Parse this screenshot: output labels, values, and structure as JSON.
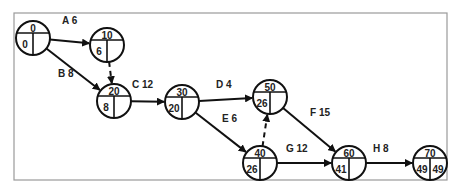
{
  "diagram": {
    "type": "activity-on-arrow network (CPM)",
    "frame": {
      "x": 14,
      "y": 13,
      "w": 433,
      "h": 167,
      "stroke": "#9a9a9a"
    },
    "nodes": [
      {
        "id": "0",
        "x": 33,
        "y": 38,
        "label": "0",
        "es": "0",
        "ls": ""
      },
      {
        "id": "10",
        "x": 107,
        "y": 45,
        "label": "10",
        "es": "6",
        "ls": ""
      },
      {
        "id": "20",
        "x": 114,
        "y": 101,
        "label": "20",
        "es": "8",
        "ls": ""
      },
      {
        "id": "30",
        "x": 182,
        "y": 102,
        "label": "30",
        "es": "20",
        "ls": ""
      },
      {
        "id": "50",
        "x": 270,
        "y": 97,
        "label": "50",
        "es": "26",
        "ls": ""
      },
      {
        "id": "40",
        "x": 260,
        "y": 163,
        "label": "40",
        "es": "26",
        "ls": ""
      },
      {
        "id": "60",
        "x": 349,
        "y": 163,
        "label": "60",
        "es": "41",
        "ls": ""
      },
      {
        "id": "70",
        "x": 430,
        "y": 163,
        "label": "70",
        "es": "49",
        "ls": "49"
      }
    ],
    "edges": [
      {
        "from": "0",
        "to": "10",
        "label": "A 6",
        "dummy": false,
        "lx": 62,
        "ly": 24
      },
      {
        "from": "0",
        "to": "20",
        "label": "B 8",
        "dummy": false,
        "lx": 58,
        "ly": 77
      },
      {
        "from": "10",
        "to": "20",
        "label": "",
        "dummy": true,
        "lx": 0,
        "ly": 0
      },
      {
        "from": "20",
        "to": "30",
        "label": "C 12",
        "dummy": false,
        "lx": 132,
        "ly": 88
      },
      {
        "from": "30",
        "to": "50",
        "label": "D 4",
        "dummy": false,
        "lx": 216,
        "ly": 88
      },
      {
        "from": "30",
        "to": "40",
        "label": "E 6",
        "dummy": false,
        "lx": 222,
        "ly": 122
      },
      {
        "from": "40",
        "to": "50",
        "label": "",
        "dummy": true,
        "lx": 0,
        "ly": 0
      },
      {
        "from": "50",
        "to": "60",
        "label": "F 15",
        "dummy": false,
        "lx": 310,
        "ly": 116
      },
      {
        "from": "40",
        "to": "60",
        "label": "G 12",
        "dummy": false,
        "lx": 286,
        "ly": 152
      },
      {
        "from": "60",
        "to": "70",
        "label": "H 8",
        "dummy": false,
        "lx": 373,
        "ly": 152
      }
    ]
  }
}
